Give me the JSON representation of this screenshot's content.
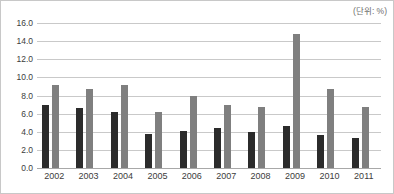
{
  "unit_note": "(단위: %)",
  "chart_data": {
    "type": "bar",
    "title": "",
    "subtitle": "",
    "xlabel": "",
    "ylabel": "",
    "unit_label": "(단위: %)",
    "categories": [
      "2002",
      "2003",
      "2004",
      "2005",
      "2006",
      "2007",
      "2008",
      "2009",
      "2010",
      "2011"
    ],
    "series": [
      {
        "name": "series-1",
        "color": "#2b2b2b",
        "values": [
          7.0,
          6.6,
          6.2,
          3.8,
          4.1,
          4.4,
          4.0,
          4.6,
          3.6,
          3.3
        ]
      },
      {
        "name": "series-2",
        "color": "#7f7f7f",
        "values": [
          9.2,
          8.7,
          9.2,
          6.2,
          7.9,
          7.0,
          6.7,
          14.8,
          8.7,
          6.7
        ]
      }
    ],
    "ylim": [
      0.0,
      16.0
    ],
    "ytick_step": 2.0,
    "ytick_labels": [
      "16.0",
      "14.0",
      "12.0",
      "10.0",
      "8.0",
      "6.0",
      "4.0",
      "2.0",
      "0.0"
    ],
    "ytick_values": [
      16.0,
      14.0,
      12.0,
      10.0,
      8.0,
      6.0,
      4.0,
      2.0,
      0.0
    ],
    "grid": true,
    "legend": "none",
    "legend_position": "none"
  }
}
